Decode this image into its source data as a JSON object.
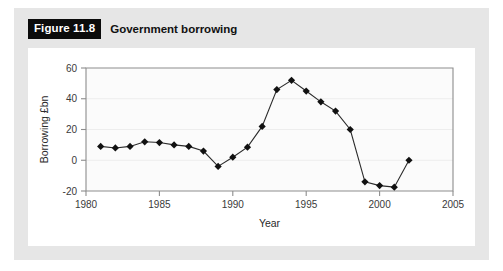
{
  "figure": {
    "badge_label": "Figure 11.8",
    "caption": "Government borrowing"
  },
  "colors": {
    "badge_background": "#0b0b0b",
    "badge_text": "#ffffff",
    "panel_background": "#e6e6e6",
    "card_background": "#ffffff",
    "axis": "#8d8d8d",
    "line": "#2b2b2b",
    "marker": "#111111"
  },
  "chart_data": {
    "type": "line",
    "title": "Government borrowing",
    "xlabel": "Year",
    "ylabel": "Borrowing £bn",
    "xlim": [
      1980,
      2005
    ],
    "ylim": [
      -20,
      60
    ],
    "xticks": [
      1980,
      1985,
      1990,
      1995,
      2000,
      2005
    ],
    "yticks": [
      -20,
      0,
      20,
      40,
      60
    ],
    "xtick_labels": [
      "1980",
      "1985",
      "1990",
      "1995",
      "2000",
      "2005"
    ],
    "ytick_labels": [
      "-20",
      "0",
      "20",
      "40",
      "60"
    ],
    "grid": false,
    "legend": "none",
    "marker": "diamond",
    "x": [
      1981,
      1982,
      1983,
      1984,
      1985,
      1986,
      1987,
      1988,
      1989,
      1990,
      1991,
      1992,
      1993,
      1994,
      1995,
      1996,
      1997,
      1998,
      1999,
      2000,
      2001,
      2002
    ],
    "values": [
      9,
      8,
      9,
      12,
      11.5,
      10,
      9,
      6,
      -4,
      2,
      8.5,
      22,
      46,
      52,
      45,
      38,
      32,
      20,
      -14,
      -16.5,
      -17.5,
      0
    ],
    "series": [
      {
        "name": "Borrowing £bn",
        "values": [
          9,
          8,
          9,
          12,
          11.5,
          10,
          9,
          6,
          -4,
          2,
          8.5,
          22,
          46,
          52,
          45,
          38,
          32,
          20,
          -14,
          -16.5,
          -17.5,
          0
        ]
      }
    ]
  }
}
